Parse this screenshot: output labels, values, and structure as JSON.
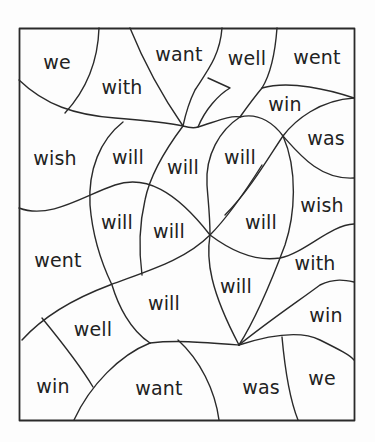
{
  "worksheet": {
    "title": "",
    "regions": [
      {
        "word": "we",
        "x": 57,
        "y": 62
      },
      {
        "word": "with",
        "x": 122,
        "y": 87
      },
      {
        "word": "want",
        "x": 179,
        "y": 54
      },
      {
        "word": "well",
        "x": 247,
        "y": 58
      },
      {
        "word": "went",
        "x": 317,
        "y": 57
      },
      {
        "word": "win",
        "x": 285,
        "y": 104
      },
      {
        "word": "was",
        "x": 326,
        "y": 138
      },
      {
        "word": "wish",
        "x": 55,
        "y": 158
      },
      {
        "word": "will",
        "x": 128,
        "y": 157
      },
      {
        "word": "will",
        "x": 183,
        "y": 167
      },
      {
        "word": "will",
        "x": 240,
        "y": 157
      },
      {
        "word": "wish",
        "x": 322,
        "y": 205
      },
      {
        "word": "will",
        "x": 117,
        "y": 222
      },
      {
        "word": "will",
        "x": 169,
        "y": 231
      },
      {
        "word": "will",
        "x": 261,
        "y": 222
      },
      {
        "word": "went",
        "x": 58,
        "y": 260
      },
      {
        "word": "with",
        "x": 315,
        "y": 263
      },
      {
        "word": "will",
        "x": 236,
        "y": 286
      },
      {
        "word": "will",
        "x": 164,
        "y": 303
      },
      {
        "word": "win",
        "x": 326,
        "y": 315
      },
      {
        "word": "well",
        "x": 93,
        "y": 329
      },
      {
        "word": "win",
        "x": 53,
        "y": 386
      },
      {
        "word": "want",
        "x": 159,
        "y": 388
      },
      {
        "word": "was",
        "x": 261,
        "y": 387
      },
      {
        "word": "we",
        "x": 322,
        "y": 378
      }
    ]
  },
  "colors": {
    "line": "#2a2a2a",
    "text": "#222222",
    "background": "#fdfdfd"
  }
}
